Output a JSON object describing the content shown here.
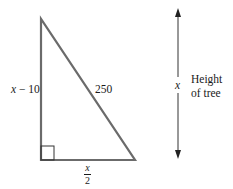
{
  "diagram": {
    "type": "right-triangle",
    "stroke_color": "#6b6b6b",
    "text_color": "#1a1a1a",
    "labels": {
      "left_side_var": "x",
      "left_side_rest": " − 10",
      "hypotenuse": "250",
      "base_numerator": "x",
      "base_denominator": "2",
      "arrow_var": "x",
      "height_line1": "Height",
      "height_line2": "of tree"
    }
  }
}
